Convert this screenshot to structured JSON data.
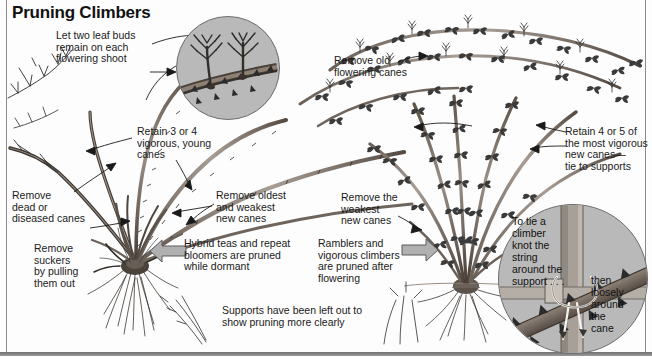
{
  "title": "Pruning Climbers",
  "colors": {
    "ink": "#1a1a1a",
    "inset_fill": "#b9b9b9",
    "inset_stroke": "#6d6d6d",
    "arrow_fill": "#b0b0b0",
    "arrow_stroke": "#5a5a5a",
    "frame": "#8a8a8a",
    "page": "#fdfdfd"
  },
  "labels": {
    "leaf_buds": "Let two leaf buds\nremain on each\nflowering shoot",
    "retain_3_or_4": "Retain 3 or 4\nvigorous, young\ncanes",
    "remove_dead": "Remove\ndead or\ndiseased canes",
    "remove_suckers": "Remove\nsuckers\nby pulling\nthem out",
    "remove_oldest": "Remove oldest\nand weakest\nnew canes",
    "remove_old_flowering": "Remove old\nflowering canes",
    "remove_weakest": "Remove the\nweakest\nnew canes",
    "retain_4_or_5": "Retain 4 or 5 of\nthe most vigorous\nnew canes—\ntie to supports",
    "hybrid_teas": "Hybrid teas and repeat\nbloomers are pruned\nwhile dormant",
    "ramblers": "Ramblers and\nvigorous climbers\nare pruned after\nflowering",
    "supports_note": "Supports have been left out to\nshow pruning more clearly",
    "tie_climber": "To tie a\nclimber\nknot the\nstring\naround the\nsupport . . .",
    "then_loosely": "then\nloosely\naround\nthe\ncane"
  },
  "icons": {
    "inset_top_left": "magnified-cane-detail-icon",
    "inset_bottom_right": "string-tie-detail-icon",
    "arrow_left": "block-arrow-left-icon",
    "arrow_right": "block-arrow-right-icon",
    "plant_left": "dormant-climbing-rose-illustration",
    "plant_right": "leafy-rambler-rose-illustration"
  }
}
